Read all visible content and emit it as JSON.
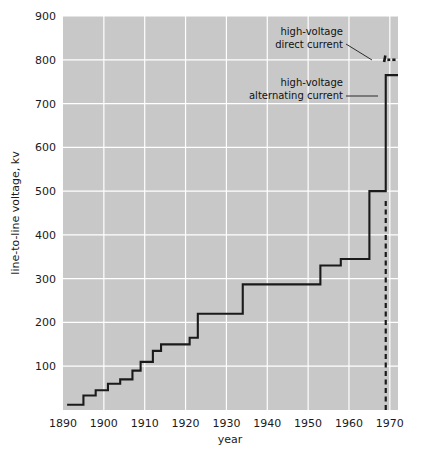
{
  "chart_data": {
    "type": "line",
    "title": "",
    "xlabel": "year",
    "ylabel": "line-to-line voltage, kv",
    "xlim": [
      1890,
      1972
    ],
    "ylim": [
      0,
      900
    ],
    "grid": true,
    "legend_position": "none",
    "xticks": [
      1890,
      1900,
      1910,
      1920,
      1930,
      1940,
      1950,
      1960,
      1970
    ],
    "xtick_labels": [
      "1890",
      "1900",
      "1910",
      "1920",
      "1930",
      "1940",
      "1950",
      "1960",
      "1970"
    ],
    "yticks": [
      100,
      200,
      300,
      400,
      500,
      600,
      700,
      800,
      900
    ],
    "ytick_labels": [
      "100",
      "200",
      "300",
      "400",
      "500",
      "600",
      "700",
      "800",
      "900"
    ],
    "series": [
      {
        "name": "high-voltage alternating current",
        "style": "solid-step",
        "color": "#1a1a1a",
        "points": [
          {
            "year": 1891,
            "kv": 12
          },
          {
            "year": 1895,
            "kv": 12
          },
          {
            "year": 1895,
            "kv": 33
          },
          {
            "year": 1898,
            "kv": 33
          },
          {
            "year": 1898,
            "kv": 45
          },
          {
            "year": 1901,
            "kv": 45
          },
          {
            "year": 1901,
            "kv": 60
          },
          {
            "year": 1904,
            "kv": 60
          },
          {
            "year": 1904,
            "kv": 70
          },
          {
            "year": 1907,
            "kv": 70
          },
          {
            "year": 1907,
            "kv": 90
          },
          {
            "year": 1909,
            "kv": 90
          },
          {
            "year": 1909,
            "kv": 110
          },
          {
            "year": 1912,
            "kv": 110
          },
          {
            "year": 1912,
            "kv": 135
          },
          {
            "year": 1914,
            "kv": 135
          },
          {
            "year": 1914,
            "kv": 150
          },
          {
            "year": 1921,
            "kv": 150
          },
          {
            "year": 1921,
            "kv": 165
          },
          {
            "year": 1923,
            "kv": 165
          },
          {
            "year": 1923,
            "kv": 220
          },
          {
            "year": 1934,
            "kv": 220
          },
          {
            "year": 1934,
            "kv": 287
          },
          {
            "year": 1953,
            "kv": 287
          },
          {
            "year": 1953,
            "kv": 330
          },
          {
            "year": 1958,
            "kv": 330
          },
          {
            "year": 1958,
            "kv": 345
          },
          {
            "year": 1965,
            "kv": 345
          },
          {
            "year": 1965,
            "kv": 500
          },
          {
            "year": 1969,
            "kv": 500
          },
          {
            "year": 1969,
            "kv": 765
          },
          {
            "year": 1972,
            "kv": 765
          }
        ]
      },
      {
        "name": "high-voltage direct current",
        "style": "dashed-segments",
        "color": "#1a1a1a",
        "segments": [
          {
            "x0": 1968.6,
            "x1": 1968.9,
            "y0": 795,
            "y1": 810
          },
          {
            "x0": 1969.4,
            "x1": 1970.1,
            "y0": 800,
            "y1": 800
          },
          {
            "x0": 1970.6,
            "x1": 1971.4,
            "y0": 800,
            "y1": 800
          }
        ]
      },
      {
        "name": "dc-vertical-marker",
        "style": "dashed-vertical",
        "color": "#1a1a1a",
        "x": 1969,
        "y0": 0,
        "y1": 480
      }
    ],
    "annotations": [
      {
        "id": "hvdc",
        "line1": "high-voltage",
        "line2": "direct current",
        "text_anchor": "end",
        "text_x": 343,
        "text_y1": 35,
        "text_y2": 48,
        "leader": {
          "x1": 346,
          "y1": 44,
          "x2": 372,
          "y2": 60
        }
      },
      {
        "id": "hvac",
        "line1": "high-voltage",
        "line2": "alternating current",
        "text_anchor": "end",
        "text_x": 343,
        "text_y1": 86,
        "text_y2": 99,
        "leader": {
          "x1": 346,
          "y1": 96,
          "x2": 378,
          "y2": 96
        }
      }
    ],
    "colors": {
      "plot_background": "#c8c8c8",
      "grid": "#ffffff",
      "line": "#1a1a1a",
      "figure_background": "#ffffff",
      "text": "#1a1a1a"
    }
  }
}
